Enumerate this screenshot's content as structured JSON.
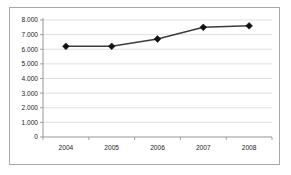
{
  "chart_data": {
    "type": "line",
    "title": "",
    "subtitle": "",
    "xlabel": "",
    "ylabel": "",
    "categories": [
      "2004",
      "2005",
      "2006",
      "2007",
      "2008"
    ],
    "values": [
      6200,
      6200,
      6700,
      7500,
      7600
    ],
    "series": [
      {
        "name": "",
        "values": [
          6200,
          6200,
          6700,
          7500,
          7600
        ]
      }
    ],
    "ylim": [
      0,
      8000
    ],
    "ytick_labels": [
      "8.000",
      "7.000",
      "6.000",
      "5.000",
      "4.000",
      "3.000",
      "2.000",
      "1.000",
      "0"
    ],
    "ytick_values": [
      8000,
      7000,
      6000,
      5000,
      4000,
      3000,
      2000,
      1000,
      0
    ],
    "xtick_labels": [
      "2004",
      "2005",
      "2006",
      "2007",
      "2008"
    ],
    "grid": true,
    "grid_axis": "y",
    "legend": false,
    "legend_position": "none",
    "marker": "diamond",
    "annotations": []
  },
  "style": {
    "line_color": "#3b3b3b",
    "marker_color": "#111111",
    "grid_color": "#d3d3d3",
    "axis_color": "#8a8a8a",
    "frame_color": "#a8a8a8",
    "background": "#ffffff",
    "text_color": "#222222"
  }
}
